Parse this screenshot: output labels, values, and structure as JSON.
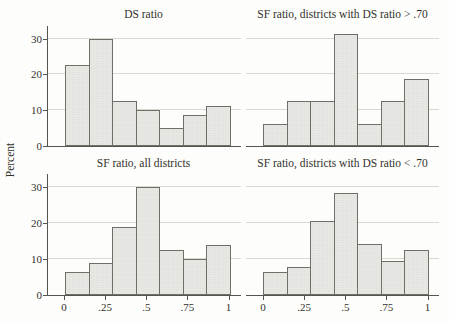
{
  "figure": {
    "y_axis_label": "Percent",
    "y_tick_labels": [
      "0",
      "10",
      "20",
      "30"
    ],
    "x_tick_labels": [
      "0",
      ".25",
      ".5",
      ".75",
      "1"
    ]
  },
  "styles": {
    "background": "#fdfdfb",
    "bar_fill": "#e7e7e4",
    "bar_stipple": "#d7d7d2",
    "bar_border": "#6f6f68",
    "gridline": "#dbd8cf",
    "axis": "#55544e",
    "text": "#32322d"
  },
  "chart_data": [
    {
      "type": "bar",
      "subtype": "histogram",
      "title": "DS ratio",
      "position": "top-left",
      "x_range": [
        0,
        1
      ],
      "n_bins": 7,
      "bin_width": 0.1429,
      "bin_starts": [
        0,
        0.1429,
        0.2857,
        0.4286,
        0.5714,
        0.7143,
        0.8571
      ],
      "values": [
        22.5,
        30,
        12.5,
        10,
        5,
        8.75,
        11.25
      ],
      "ylabel": "Percent",
      "ylim": [
        0,
        33.5
      ],
      "y_gridlines": [
        10,
        20,
        30
      ],
      "grid": "horizontal only",
      "legend": "none"
    },
    {
      "type": "bar",
      "subtype": "histogram",
      "title": "SF ratio, districts with DS ratio > .70",
      "position": "top-right",
      "x_range": [
        0,
        1
      ],
      "n_bins": 7,
      "bin_width": 0.1429,
      "bin_starts": [
        0,
        0.1429,
        0.2857,
        0.4286,
        0.5714,
        0.7143,
        0.8571
      ],
      "values": [
        6.25,
        12.5,
        12.5,
        31.25,
        6.25,
        12.5,
        18.75
      ],
      "ylabel": "Percent",
      "ylim": [
        0,
        33.5
      ],
      "y_gridlines": [
        10,
        20,
        30
      ],
      "grid": "horizontal only",
      "legend": "none"
    },
    {
      "type": "bar",
      "subtype": "histogram",
      "title": "SF ratio, all districts",
      "position": "bottom-left",
      "x_range": [
        0,
        1
      ],
      "n_bins": 7,
      "bin_width": 0.1429,
      "bin_starts": [
        0,
        0.1429,
        0.2857,
        0.4286,
        0.5714,
        0.7143,
        0.8571
      ],
      "values": [
        6.25,
        8.75,
        18.75,
        30,
        12.5,
        10,
        13.75
      ],
      "ylabel": "Percent",
      "ylim": [
        0,
        33.5
      ],
      "y_gridlines": [
        10,
        20,
        30
      ],
      "grid": "horizontal only",
      "legend": "none"
    },
    {
      "type": "bar",
      "subtype": "histogram",
      "title": "SF ratio, districts with DS ratio < .70",
      "position": "bottom-right",
      "x_range": [
        0,
        1
      ],
      "n_bins": 7,
      "bin_width": 0.1429,
      "bin_starts": [
        0,
        0.1429,
        0.2857,
        0.4286,
        0.5714,
        0.7143,
        0.8571
      ],
      "values": [
        6.25,
        7.9,
        20.5,
        28.3,
        14.1,
        9.4,
        12.5
      ],
      "ylabel": "Percent",
      "ylim": [
        0,
        33.5
      ],
      "y_gridlines": [
        10,
        20,
        30
      ],
      "grid": "horizontal only",
      "legend": "none"
    }
  ]
}
